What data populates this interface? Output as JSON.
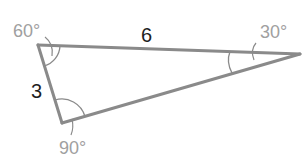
{
  "diagram": {
    "type": "triangle",
    "colors": {
      "stroke": "#8a8a8a",
      "side_label": "#1e1e1e",
      "angle_label": "#a0a0a0",
      "background": "#ffffff"
    },
    "vertices": {
      "A": {
        "x": 38,
        "y": 45,
        "angle_label": "60°"
      },
      "B": {
        "x": 62,
        "y": 123,
        "angle_label": "90°"
      },
      "C": {
        "x": 300,
        "y": 54,
        "angle_label": "30°"
      }
    },
    "sides": {
      "AC": {
        "label": "6"
      },
      "AB": {
        "label": "3"
      },
      "BC": {
        "label": ""
      }
    }
  }
}
